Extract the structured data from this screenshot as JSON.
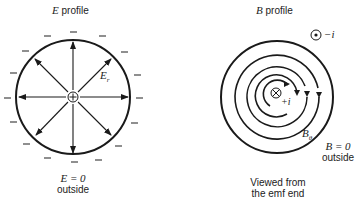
{
  "e_panel": {
    "title_var": "E",
    "title_word": "profile",
    "field_label": "E",
    "field_sub": "r",
    "center_symbol": "⊕",
    "outside_eq": "E = 0",
    "outside_word": "outside",
    "charge_sign": "–"
  },
  "b_panel": {
    "title_var": "B",
    "title_word": "profile",
    "return_current": "−i",
    "center_current": "+i",
    "field_label": "B",
    "field_sub": "θ",
    "outside_eq": "B = 0",
    "outside_word": "outside",
    "caption_line1": "Viewed from",
    "caption_line2": "the emf end"
  },
  "colors": {
    "ink": "#1a1a1a",
    "background": "#ffffff"
  }
}
